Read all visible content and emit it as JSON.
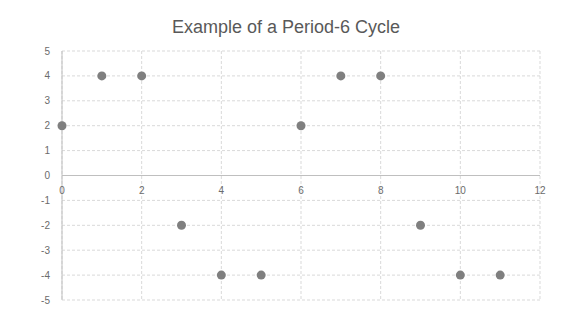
{
  "chart_data": {
    "type": "scatter",
    "title": "Example of a Period-6 Cycle",
    "xlabel": "",
    "ylabel": "",
    "xlim": [
      0,
      12
    ],
    "ylim": [
      -5,
      5
    ],
    "x_ticks": [
      0,
      2,
      4,
      6,
      8,
      10,
      12
    ],
    "y_ticks": [
      5,
      4,
      3,
      2,
      1,
      0,
      -1,
      -2,
      -3,
      -4,
      -5
    ],
    "grid": true,
    "legend": null,
    "marker_color": "#7f7f7f",
    "series": [
      {
        "name": "Series 1",
        "points": [
          {
            "x": 0,
            "y": 2
          },
          {
            "x": 1,
            "y": 4
          },
          {
            "x": 2,
            "y": 4
          },
          {
            "x": 3,
            "y": -2
          },
          {
            "x": 4,
            "y": -4
          },
          {
            "x": 5,
            "y": -4
          },
          {
            "x": 6,
            "y": 2
          },
          {
            "x": 7,
            "y": 4
          },
          {
            "x": 8,
            "y": 4
          },
          {
            "x": 9,
            "y": -2
          },
          {
            "x": 10,
            "y": -4
          },
          {
            "x": 11,
            "y": -4
          }
        ]
      }
    ]
  }
}
